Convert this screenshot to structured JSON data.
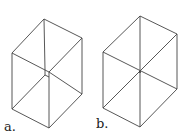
{
  "figures": [
    {
      "label": "a.",
      "description": "hexagonal outline of a box with inner edges meeting at a small square (truncated corner)"
    },
    {
      "label": "b.",
      "description": "hexagonal outline of a box with three diagonals meeting at a single center point"
    }
  ],
  "colors": {
    "stroke": "#444444",
    "background": "#ffffff"
  }
}
